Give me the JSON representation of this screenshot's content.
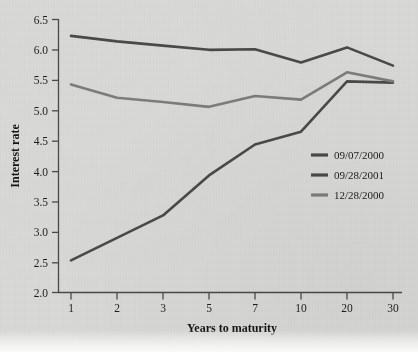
{
  "figure": {
    "background_color": "#d9d9d7",
    "ink_color": "#3b3b3b"
  },
  "chart_data": {
    "type": "line",
    "title": "",
    "xlabel": "Years to maturity",
    "ylabel": "Interest rate",
    "categories": [
      "1",
      "2",
      "3",
      "5",
      "7",
      "10",
      "20",
      "30"
    ],
    "x_tick_labels": [
      "1",
      "2",
      "3",
      "5",
      "7",
      "10",
      "20",
      "30"
    ],
    "y_tick_labels": [
      "2.0",
      "2.5",
      "3.0",
      "3.5",
      "4.0",
      "4.5",
      "5.0",
      "5.5",
      "6.0",
      "6.5"
    ],
    "y_tick_values": [
      2.0,
      2.5,
      3.0,
      3.5,
      4.0,
      4.5,
      5.0,
      5.5,
      6.0,
      6.5
    ],
    "ylim": [
      2.0,
      6.5
    ],
    "grid": false,
    "legend_position": "center-right",
    "series": [
      {
        "name": "09/07/2000",
        "color": "#4a4a4a",
        "values": [
          6.23,
          6.14,
          6.07,
          6.0,
          6.01,
          5.79,
          6.04,
          5.74
        ]
      },
      {
        "name": "09/28/2001",
        "color": "#4a4a4a",
        "values": [
          2.53,
          2.9,
          3.27,
          3.93,
          4.44,
          4.65,
          5.48,
          5.46
        ]
      },
      {
        "name": "12/28/2000",
        "color": "#7d7d7d",
        "values": [
          5.43,
          5.21,
          5.14,
          5.06,
          5.24,
          5.18,
          5.63,
          5.48
        ]
      }
    ]
  },
  "legend": {
    "entries": [
      {
        "label": "09/07/2000",
        "color": "#4a4a4a"
      },
      {
        "label": "09/28/2001",
        "color": "#4a4a4a"
      },
      {
        "label": "12/28/2000",
        "color": "#7d7d7d"
      }
    ]
  }
}
